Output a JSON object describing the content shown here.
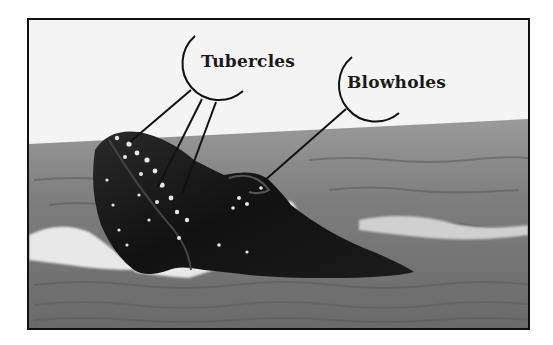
{
  "diagram": {
    "type": "labeled-photo",
    "labels": [
      {
        "id": "tubercles",
        "text": "Tubercles",
        "pointer_count": 3
      },
      {
        "id": "blowholes",
        "text": "Blowholes",
        "pointer_count": 1
      }
    ],
    "colors": {
      "frame": "#111111",
      "sky": "#f4f4f4",
      "sea": "#8a8a8a",
      "whale": "#141414",
      "callout": "#111111"
    }
  }
}
